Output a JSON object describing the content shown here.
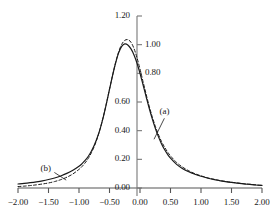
{
  "chart_data": {
    "type": "line",
    "title": "",
    "subtitle": "",
    "xlabel": "",
    "ylabel": "",
    "xlim": [
      -2.0,
      2.0
    ],
    "ylim": [
      0.0,
      1.2
    ],
    "grid": false,
    "legend_position": "inline-annotations",
    "x_ticks": [
      {
        "value": -2.0,
        "label": "−2.00"
      },
      {
        "value": -1.5,
        "label": "−1.50"
      },
      {
        "value": -1.0,
        "label": "−1.00"
      },
      {
        "value": -0.5,
        "label": "−0.50"
      },
      {
        "value": 0.0,
        "label": "0.00"
      },
      {
        "value": 0.5,
        "label": "0.50"
      },
      {
        "value": 1.0,
        "label": "1.00"
      },
      {
        "value": 1.5,
        "label": "1.50"
      },
      {
        "value": 2.0,
        "label": "2.00"
      }
    ],
    "y_ticks": [
      {
        "value": 0.0,
        "label": "0.00",
        "side": "left"
      },
      {
        "value": 0.2,
        "label": "0.20",
        "side": "left"
      },
      {
        "value": 0.4,
        "label": "0.40",
        "side": "left"
      },
      {
        "value": 0.6,
        "label": "0.60",
        "side": "left"
      },
      {
        "value": 0.8,
        "label": "0.80",
        "side": "right"
      },
      {
        "value": 1.0,
        "label": "1.00",
        "side": "right"
      },
      {
        "value": 1.2,
        "label": "1.20",
        "side": "left"
      }
    ],
    "annotations": [
      {
        "id": "a",
        "label": "(a)",
        "x": 0.45,
        "y": 0.53,
        "leader_to_x": 0.23,
        "leader_to_y": 0.34
      },
      {
        "id": "b",
        "label": "(b)",
        "x": -1.5,
        "y": 0.135,
        "leader_to_x": -1.21,
        "leader_to_y": 0.055
      }
    ],
    "series": [
      {
        "name": "(a)",
        "style": "dashed",
        "color": "#1a1a1a",
        "x": [
          -2.0,
          -1.9,
          -1.8,
          -1.7,
          -1.6,
          -1.5,
          -1.4,
          -1.3,
          -1.2,
          -1.1,
          -1.0,
          -0.95,
          -0.9,
          -0.85,
          -0.8,
          -0.75,
          -0.7,
          -0.65,
          -0.6,
          -0.55,
          -0.5,
          -0.45,
          -0.4,
          -0.35,
          -0.3,
          -0.25,
          -0.2,
          -0.15,
          -0.1,
          -0.05,
          0.0,
          0.05,
          0.1,
          0.15,
          0.2,
          0.25,
          0.3,
          0.35,
          0.4,
          0.45,
          0.5,
          0.6,
          0.7,
          0.8,
          0.9,
          1.0,
          1.1,
          1.2,
          1.3,
          1.4,
          1.5,
          1.6,
          1.7,
          1.8,
          1.9,
          2.0
        ],
        "y": [
          0.01,
          0.013,
          0.017,
          0.022,
          0.028,
          0.035,
          0.045,
          0.058,
          0.075,
          0.098,
          0.13,
          0.15,
          0.175,
          0.205,
          0.243,
          0.29,
          0.348,
          0.418,
          0.5,
          0.592,
          0.69,
          0.785,
          0.875,
          0.95,
          1.002,
          1.03,
          1.035,
          1.018,
          0.975,
          0.91,
          0.83,
          0.742,
          0.655,
          0.572,
          0.498,
          0.432,
          0.375,
          0.327,
          0.287,
          0.253,
          0.224,
          0.178,
          0.145,
          0.12,
          0.1,
          0.085,
          0.072,
          0.062,
          0.053,
          0.046,
          0.04,
          0.035,
          0.03,
          0.026,
          0.022,
          0.018
        ]
      },
      {
        "name": "(b)",
        "style": "solid",
        "color": "#1a1a1a",
        "x": [
          -2.0,
          -1.9,
          -1.8,
          -1.7,
          -1.6,
          -1.5,
          -1.4,
          -1.3,
          -1.2,
          -1.1,
          -1.0,
          -0.95,
          -0.9,
          -0.85,
          -0.8,
          -0.75,
          -0.7,
          -0.65,
          -0.6,
          -0.55,
          -0.5,
          -0.45,
          -0.4,
          -0.35,
          -0.3,
          -0.25,
          -0.2,
          -0.15,
          -0.1,
          -0.05,
          0.0,
          0.05,
          0.1,
          0.15,
          0.2,
          0.25,
          0.3,
          0.35,
          0.4,
          0.45,
          0.5,
          0.6,
          0.7,
          0.8,
          0.9,
          1.0,
          1.1,
          1.2,
          1.3,
          1.4,
          1.5,
          1.6,
          1.7,
          1.8,
          1.9,
          2.0
        ],
        "y": [
          0.028,
          0.032,
          0.037,
          0.043,
          0.05,
          0.059,
          0.07,
          0.084,
          0.102,
          0.124,
          0.152,
          0.17,
          0.192,
          0.22,
          0.255,
          0.298,
          0.352,
          0.418,
          0.498,
          0.59,
          0.688,
          0.784,
          0.872,
          0.943,
          0.988,
          1.005,
          0.998,
          0.972,
          0.93,
          0.872,
          0.8,
          0.72,
          0.638,
          0.558,
          0.484,
          0.418,
          0.36,
          0.311,
          0.27,
          0.236,
          0.208,
          0.165,
          0.135,
          0.113,
          0.096,
          0.082,
          0.07,
          0.06,
          0.052,
          0.045,
          0.039,
          0.034,
          0.029,
          0.025,
          0.021,
          0.018
        ]
      }
    ]
  },
  "axes": {
    "y_axis_name": "vertical-value-axis",
    "x_axis_name": "horizontal-value-axis"
  }
}
